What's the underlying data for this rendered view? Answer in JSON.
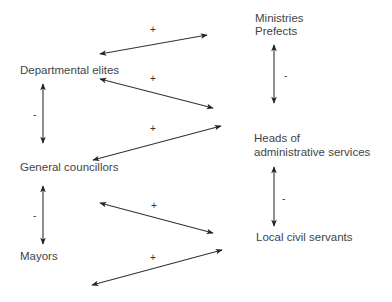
{
  "diagram": {
    "left_nodes": {
      "departmental_elites": "Departmental elites",
      "general_councillors": "General councillors",
      "mayors": "Mayors"
    },
    "right_nodes": {
      "ministries_line1": "Ministries",
      "ministries_line2": "Prefects",
      "heads_line1": "Heads of",
      "heads_line2": "administrative services",
      "local_civil_servants": "Local civil servants"
    },
    "relations": [
      {
        "from": "Departmental elites",
        "to": "Ministries / Prefects",
        "sign": "+"
      },
      {
        "from": "Departmental elites",
        "to": "Heads of administrative services",
        "sign": "+"
      },
      {
        "from": "General councillors",
        "to": "Heads of administrative services",
        "sign": "+"
      },
      {
        "from": "General councillors",
        "to": "Local civil servants",
        "sign": "+"
      },
      {
        "from": "Mayors",
        "to": "Local civil servants",
        "sign": "+"
      },
      {
        "from": "Departmental elites",
        "to": "General councillors",
        "sign": "-"
      },
      {
        "from": "General councillors",
        "to": "Mayors",
        "sign": "-"
      },
      {
        "from": "Ministries / Prefects",
        "to": "Heads of administrative services",
        "sign": "-"
      },
      {
        "from": "Heads of administrative services",
        "to": "Local civil servants",
        "sign": "-"
      }
    ],
    "signs": {
      "plus": "+",
      "minus": "-"
    }
  }
}
